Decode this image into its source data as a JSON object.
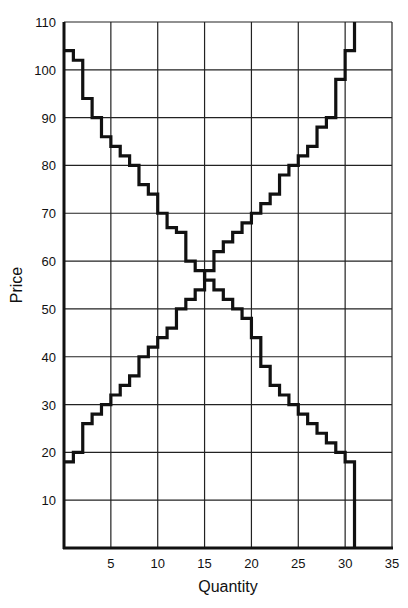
{
  "chart_data": {
    "type": "line",
    "subtype": "step",
    "title": "",
    "xlabel": "Quantity",
    "ylabel": "Price",
    "xlim": [
      0,
      35
    ],
    "ylim": [
      0,
      110
    ],
    "xticks": [
      5,
      10,
      15,
      20,
      25,
      30,
      35
    ],
    "yticks": [
      10,
      20,
      30,
      40,
      50,
      60,
      70,
      80,
      90,
      100,
      110
    ],
    "grid": true,
    "grid_x_step": 5,
    "grid_y_step": 10,
    "legend": null,
    "series": [
      {
        "name": "Demand",
        "step_start_quantity": 0,
        "prices_per_unit": [
          104,
          102,
          94,
          90,
          86,
          84,
          82,
          80,
          76,
          74,
          70,
          67,
          66,
          60,
          58,
          56,
          54,
          52,
          50,
          48,
          44,
          38,
          34,
          32,
          30,
          28,
          26,
          24,
          22,
          20,
          18
        ],
        "end_quantity": 31,
        "end_price": 0
      },
      {
        "name": "Supply",
        "step_start_quantity": 0,
        "prices_per_unit": [
          18,
          20,
          26,
          28,
          30,
          32,
          34,
          36,
          40,
          42,
          44,
          46,
          50,
          52,
          54,
          58,
          62,
          64,
          66,
          68,
          70,
          72,
          74,
          78,
          80,
          82,
          84,
          88,
          90,
          98,
          104
        ],
        "end_quantity": 31,
        "end_price": 110
      }
    ],
    "annotations": []
  },
  "style": {
    "line_color": "#111111",
    "grid_color": "#222222",
    "background": "#ffffff"
  },
  "layout": {
    "plot_left": 64,
    "plot_right": 392,
    "plot_top": 22,
    "plot_bottom": 548
  }
}
